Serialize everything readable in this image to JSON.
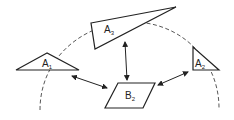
{
  "diagram": {
    "colors": {
      "stroke": "#222222",
      "background": "#ffffff"
    },
    "shapes": [
      {
        "id": "A1",
        "label": "A",
        "subscript": "1",
        "type": "triangle"
      },
      {
        "id": "A3",
        "label": "A",
        "subscript": "3",
        "type": "triangle"
      },
      {
        "id": "A2",
        "label": "A",
        "subscript": "2",
        "type": "triangle"
      },
      {
        "id": "B2",
        "label": "B",
        "subscript": "2",
        "type": "parallelogram"
      }
    ],
    "connections": [
      {
        "from": "A1",
        "to": "B2",
        "type": "bidirectional"
      },
      {
        "from": "A3",
        "to": "B2",
        "type": "bidirectional"
      },
      {
        "from": "A2",
        "to": "B2",
        "type": "bidirectional"
      }
    ],
    "arc": {
      "style": "dashed"
    }
  }
}
